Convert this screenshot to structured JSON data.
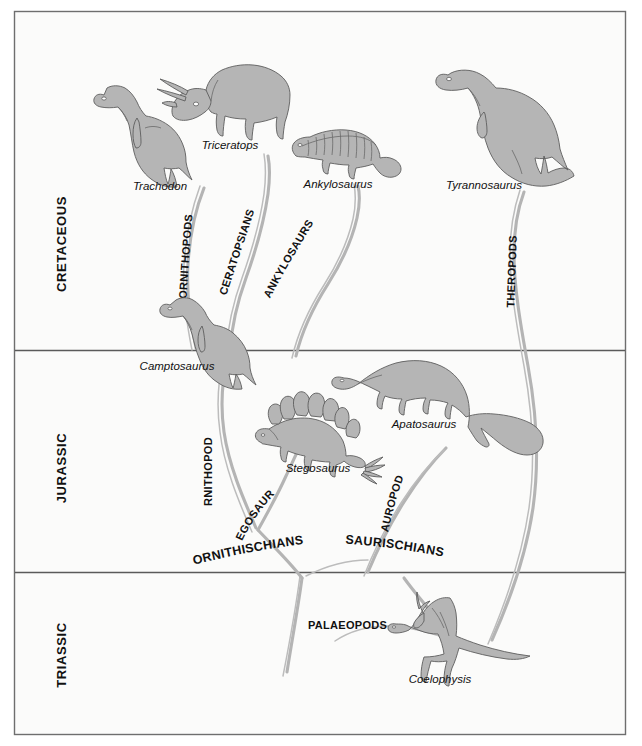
{
  "figure": {
    "domain": "diagram",
    "kind": "dinosaur-evolution-cladogram",
    "background_color": "#fbfbfa",
    "frame_color": "#6e6e6e",
    "silhouette_fill": "#b5b5b5",
    "branch_color": "#b4b4b4"
  },
  "periods": [
    {
      "id": "cretaceous",
      "label": "CRETACEOUS"
    },
    {
      "id": "jurassic",
      "label": "JURASSIC"
    },
    {
      "id": "triassic",
      "label": "TRIASSIC"
    }
  ],
  "genera": [
    {
      "id": "trachodon",
      "label": "Trachodon",
      "period": "cretaceous"
    },
    {
      "id": "triceratops",
      "label": "Triceratops",
      "period": "cretaceous"
    },
    {
      "id": "ankylosaurus",
      "label": "Ankylosaurus",
      "period": "cretaceous"
    },
    {
      "id": "tyrannosaurus",
      "label": "Tyrannosaurus",
      "period": "cretaceous"
    },
    {
      "id": "camptosaurus",
      "label": "Camptosaurus",
      "period": "jurassic"
    },
    {
      "id": "stegosaurus",
      "label": "Stegosaurus",
      "period": "jurassic"
    },
    {
      "id": "apatosaurus",
      "label": "Apatosaurus",
      "period": "jurassic"
    },
    {
      "id": "coelophysis",
      "label": "Coelophysis",
      "period": "triassic"
    }
  ],
  "groups": [
    {
      "id": "ornithopods-cretaceous",
      "label": "ORNITHOPODS"
    },
    {
      "id": "ceratopsians",
      "label": "CERATOPSIANS"
    },
    {
      "id": "ankylosaurs",
      "label": "ANKYLOSAURS"
    },
    {
      "id": "theropods",
      "label": "THEROPODS"
    },
    {
      "id": "ornithopods-jurassic",
      "label": "ORNITHOPODS"
    },
    {
      "id": "stegosaurs",
      "label": "STEGOSAURS"
    },
    {
      "id": "sauropods",
      "label": "SAUROPODS"
    },
    {
      "id": "palaeopods",
      "label": "PALAEOPODS"
    }
  ],
  "clades": [
    {
      "id": "ornithischians",
      "label": "ORNITHISCHIANS"
    },
    {
      "id": "saurischians",
      "label": "SAURISCHIANS"
    }
  ]
}
